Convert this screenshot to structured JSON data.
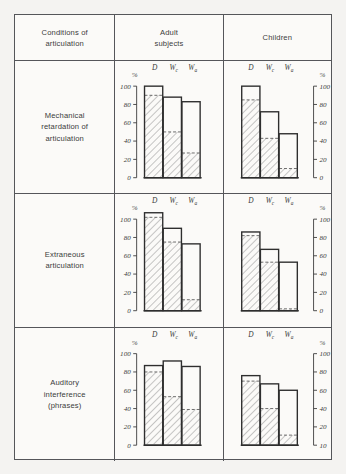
{
  "header": {
    "conditions": "Conditions of\narticulation",
    "adult": "Adult\nsubjects",
    "children": "Children"
  },
  "axis": {
    "pct_symbol": "%",
    "bar_labels": [
      "D",
      "Wc",
      "Wa"
    ],
    "ticks_standard": [
      "100",
      "80",
      "60",
      "40",
      "20",
      "0"
    ],
    "ticks_row3_children": [
      "100",
      "80",
      "60",
      "40",
      "20",
      "10"
    ]
  },
  "rows": [
    {
      "label": "Mechanical\nretardation of\narticulation"
    },
    {
      "label": "Extraneous\narticulation"
    },
    {
      "label": "Auditory\ninterference\n(phrases)"
    }
  ],
  "colors": {
    "border": "#55565a",
    "background": "#fbfaf8",
    "page_background": "#f4f3f1",
    "bar_outline": "#2e2e2e",
    "hatch": "#8d8d8d",
    "text": "#3a3a3a"
  },
  "chart_data": {
    "type": "bar",
    "xlabel": "",
    "ylabel": "%",
    "ylim": [
      0,
      100
    ],
    "grid": false,
    "legend": "none",
    "categories": [
      "D",
      "Wc",
      "Wa"
    ],
    "panels": [
      {
        "row": "Mechanical retardation of articulation",
        "group": "Adult subjects",
        "axis_side": "left",
        "ticks": [
          0,
          20,
          40,
          60,
          80,
          100
        ],
        "series": [
          {
            "name": "outline",
            "values": [
              100,
              88,
              83
            ]
          },
          {
            "name": "hatched",
            "values": [
              90,
              50,
              27
            ]
          }
        ]
      },
      {
        "row": "Mechanical retardation of articulation",
        "group": "Children",
        "axis_side": "right",
        "ticks": [
          0,
          20,
          40,
          60,
          80,
          100
        ],
        "series": [
          {
            "name": "outline",
            "values": [
              100,
              72,
              48
            ]
          },
          {
            "name": "hatched",
            "values": [
              85,
              43,
              10
            ]
          }
        ]
      },
      {
        "row": "Extraneous articulation",
        "group": "Adult subjects",
        "axis_side": "left",
        "ticks": [
          0,
          20,
          40,
          60,
          80,
          100
        ],
        "series": [
          {
            "name": "outline",
            "values": [
              107,
              90,
              73
            ]
          },
          {
            "name": "hatched",
            "values": [
              102,
              75,
              12
            ]
          }
        ]
      },
      {
        "row": "Extraneous articulation",
        "group": "Children",
        "axis_side": "right",
        "ticks": [
          0,
          20,
          40,
          60,
          80,
          100
        ],
        "series": [
          {
            "name": "outline",
            "values": [
              86,
              67,
              53
            ]
          },
          {
            "name": "hatched",
            "values": [
              82,
              53,
              2
            ]
          }
        ]
      },
      {
        "row": "Auditory interference (phrases)",
        "group": "Adult subjects",
        "axis_side": "left",
        "ticks": [
          0,
          20,
          40,
          60,
          80,
          100
        ],
        "series": [
          {
            "name": "outline",
            "values": [
              87,
              92,
              86
            ]
          },
          {
            "name": "hatched",
            "values": [
              80,
              53,
              39
            ]
          }
        ]
      },
      {
        "row": "Auditory interference (phrases)",
        "group": "Children",
        "axis_side": "right",
        "ticks": [
          10,
          20,
          40,
          60,
          80,
          100
        ],
        "series": [
          {
            "name": "outline",
            "values": [
              76,
              67,
              60
            ]
          },
          {
            "name": "hatched",
            "values": [
              70,
              40,
              11
            ]
          }
        ]
      }
    ]
  }
}
